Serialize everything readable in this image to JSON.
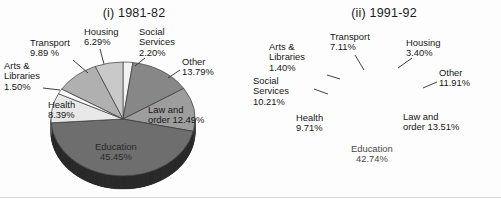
{
  "figure": {
    "background_color": "#fdfdfd",
    "charts": [
      {
        "id": "chart-1981-82",
        "title": "(i) 1981-82",
        "center": [
          123,
          119
        ],
        "radius_x": 72,
        "radius_y": 57,
        "depth": 13,
        "start_angle": -90,
        "labels": [
          {
            "name": "transport",
            "text": "Transport\n9.89 %",
            "x": 30,
            "y": 38,
            "align": "left",
            "leader": [
              [
                73,
                60
              ],
              [
                88,
                73
              ]
            ]
          },
          {
            "name": "housing",
            "text": "Housing\n6.29%",
            "x": 84,
            "y": 27,
            "align": "left",
            "leader": [
              [
                100,
                49
              ],
              [
                104,
                64
              ]
            ]
          },
          {
            "name": "social-services",
            "text": "Social\nServices\n2.20%",
            "x": 139,
            "y": 27,
            "align": "left",
            "leader": [
              [
                145,
                58
              ],
              [
                135,
                66
              ]
            ]
          },
          {
            "name": "other",
            "text": "Other\n13.79%",
            "x": 182,
            "y": 57,
            "align": "left",
            "leader": [
              [
                180,
                70
              ],
              [
                168,
                78
              ]
            ]
          },
          {
            "name": "law-and-order",
            "text": "Law and\norder 12.49%",
            "x": 148,
            "y": 105,
            "align": "left",
            "leader": null
          },
          {
            "name": "education",
            "text": "Education\n45.45%",
            "x": 95,
            "y": 142,
            "align": "inside",
            "leader": null
          },
          {
            "name": "health",
            "text": "Health\n8.39%",
            "x": 48,
            "y": 100,
            "align": "left",
            "leader": null
          },
          {
            "name": "arts-libraries",
            "text": "Arts &\nLibraries\n1.50%",
            "x": 4,
            "y": 61,
            "align": "left",
            "leader": [
              [
                43,
                88
              ],
              [
                60,
                90
              ]
            ]
          }
        ]
      },
      {
        "id": "chart-1991-92",
        "title": "(ii) 1991-92",
        "center": [
          392,
          122
        ],
        "radius_x": 72,
        "radius_y": 56,
        "depth": 13,
        "start_angle": -90,
        "labels": [
          {
            "name": "transport",
            "text": "Transport\n7.11%",
            "x": 79,
            "y": 32,
            "align": "left",
            "leader": [
              [
                104,
                55
              ],
              [
                113,
                70
              ]
            ]
          },
          {
            "name": "housing",
            "text": "Housing\n3.40%",
            "x": 155,
            "y": 38,
            "align": "left",
            "leader": [
              [
                161,
                58
              ],
              [
                147,
                68
              ]
            ]
          },
          {
            "name": "arts-libraries",
            "text": "Arts &\nLibraries\n1.40%",
            "x": 18,
            "y": 42,
            "align": "left",
            "leader": [
              [
                76,
                75
              ],
              [
                89,
                79
              ]
            ]
          },
          {
            "name": "social-services",
            "text": "Social\nServices\n10.21%",
            "x": 2,
            "y": 76,
            "align": "left",
            "leader": [
              [
                63,
                89
              ],
              [
                77,
                94
              ]
            ]
          },
          {
            "name": "other",
            "text": "Other\n11.91%",
            "x": 188,
            "y": 68,
            "align": "left",
            "leader": [
              [
                186,
                82
              ],
              [
                172,
                88
              ]
            ]
          },
          {
            "name": "law-and-order",
            "text": "Law and\norder 13.51%",
            "x": 152,
            "y": 112,
            "align": "left",
            "leader": null
          },
          {
            "name": "health",
            "text": "Health\n9.71%",
            "x": 45,
            "y": 113,
            "align": "left",
            "leader": null
          },
          {
            "name": "education",
            "text": "Education\n42.74%",
            "x": 100,
            "y": 144,
            "align": "inside",
            "leader": null
          }
        ]
      }
    ]
  },
  "chart_data": [
    {
      "type": "pie",
      "title": "(i) 1981-82",
      "categories": [
        "Education",
        "Other",
        "Law and order",
        "Transport",
        "Health",
        "Housing",
        "Social Services",
        "Arts & Libraries"
      ],
      "values": [
        45.45,
        13.79,
        12.49,
        9.89,
        8.39,
        6.29,
        2.2,
        1.5
      ],
      "labels": [
        "Education 45.45%",
        "Other 13.79%",
        "Law and order 12.49%",
        "Transport 9.89 %",
        "Health 8.39%",
        "Housing 6.29%",
        "Social Services 2.20%",
        "Arts & Libraries 1.50%"
      ],
      "unit": "percent",
      "legend": "none",
      "slice_colors": [
        "#6e6e6e",
        "#878787",
        "#9d9d9d",
        "#b0b0b0",
        "#e8e8e8",
        "#c9c9c9",
        "#f2f2f2",
        "#fbfbfb"
      ],
      "slice_order_clockwise": [
        "Social Services",
        "Other",
        "Law and order",
        "Education",
        "Health",
        "Arts & Libraries",
        "Transport",
        "Housing"
      ]
    },
    {
      "type": "pie",
      "title": "(ii) 1991-92",
      "categories": [
        "Education",
        "Law and order",
        "Other",
        "Social Services",
        "Health",
        "Transport",
        "Housing",
        "Arts & Libraries"
      ],
      "values": [
        42.74,
        13.51,
        11.91,
        10.21,
        9.71,
        7.11,
        3.4,
        1.4
      ],
      "labels": [
        "Education 42.74%",
        "Law and order 13.51%",
        "Other 11.91%",
        "Social Services 10.21%",
        "Health 9.71%",
        "Transport 7.11%",
        "Housing 3.40%",
        "Arts & Libraries 1.40%"
      ],
      "unit": "percent",
      "legend": "none",
      "slice_colors": [
        "#6e6e6e",
        "#9d9d9d",
        "#878787",
        "#d7d7d7",
        "#ededed",
        "#b4b4b4",
        "#c6c6c6",
        "#fbfbfb"
      ],
      "slice_order_clockwise": [
        "Housing",
        "Other",
        "Law and order",
        "Education",
        "Health",
        "Social Services",
        "Arts & Libraries",
        "Transport"
      ]
    }
  ]
}
